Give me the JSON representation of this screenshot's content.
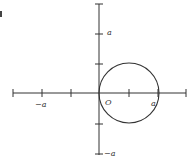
{
  "figure": {
    "colors": {
      "ink": "#333333",
      "background": "#ffffff"
    }
  },
  "labels": {
    "y_pos_a": "a",
    "y_neg_a": "−a",
    "x_neg_a": "−a",
    "x_pos_a": "a",
    "origin": "O"
  },
  "axes": {
    "x_ticks": [
      "-3a/2",
      "-a",
      "-a/2",
      "0",
      "a/2",
      "a",
      "3a/2"
    ],
    "y_ticks": [
      "3a/2",
      "a",
      "a/2",
      "0",
      "-a/2",
      "-a"
    ]
  },
  "circle": {
    "center": "(a/2, 0)",
    "radius": "a/2"
  }
}
